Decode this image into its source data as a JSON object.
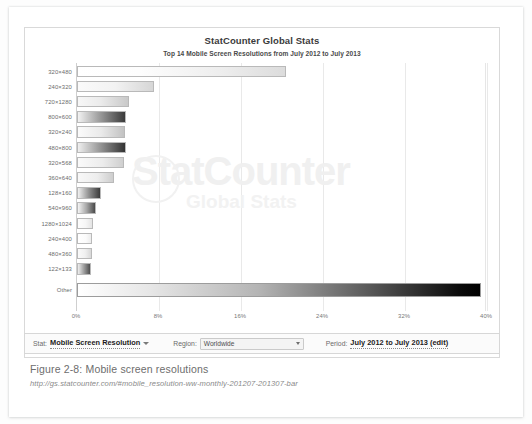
{
  "figure": {
    "caption": "Figure 2-8: Mobile screen resolutions",
    "url": "http://gs.statcounter.com/#mobile_resolution-ww-monthly-201207-201307-bar"
  },
  "chart_panel": {
    "title": "StatCounter Global Stats",
    "subtitle": "Top 14 Mobile Screen Resolutions from July 2012 to July 2013",
    "watermark_main": "StatCounter",
    "watermark_sub": "Global Stats"
  },
  "controls": {
    "stat_key": "Stat:",
    "stat_value": "Mobile Screen Resolution",
    "region_key": "Region:",
    "region_value": "Worldwide",
    "period_key": "Period:",
    "period_value": "July 2012 to July 2013 (edit)"
  },
  "chart_data": {
    "type": "bar",
    "orientation": "horizontal",
    "title": "StatCounter Global Stats",
    "subtitle": "Top 14 Mobile Screen Resolutions from July 2012 to July 2013",
    "xlabel": "",
    "ylabel": "",
    "xlim": [
      0,
      40
    ],
    "xticks": [
      0,
      8,
      16,
      24,
      32,
      40
    ],
    "xtick_labels": [
      "0%",
      "8%",
      "16%",
      "24%",
      "32%",
      "40%"
    ],
    "grid": true,
    "legend": false,
    "categories": [
      "320x480",
      "240x320",
      "720x1280",
      "800x600",
      "320x240",
      "480x800",
      "320x568",
      "360x640",
      "128x160",
      "540x960",
      "1280x1024",
      "240x400",
      "480x360",
      "122x133",
      "Other"
    ],
    "values": [
      20.4,
      7.5,
      5.1,
      4.8,
      4.7,
      4.8,
      4.6,
      3.6,
      2.3,
      1.9,
      1.6,
      1.5,
      1.5,
      1.4,
      39.4
    ]
  }
}
